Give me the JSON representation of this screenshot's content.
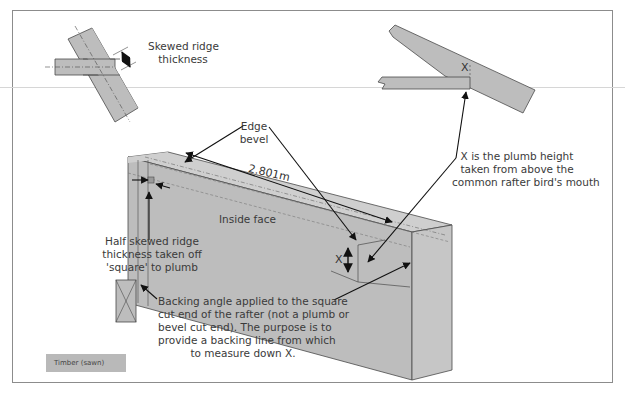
{
  "figure": {
    "labels": {
      "skewed_ridge_thickness": [
        "Skewed ridge",
        "thickness"
      ],
      "edge_bevel": [
        "Edge",
        "bevel"
      ],
      "length_dimension": "2.801m",
      "inside_face": "Inside face",
      "half_skewed_ridge": [
        "Half skewed ridge",
        "thickness taken off",
        "'square' to plumb"
      ],
      "plumb_height_note": [
        "X is the plumb height",
        "taken from above the",
        "common rafter bird's mouth"
      ],
      "backing_angle_note": [
        "Backing angle applied to the square",
        "cut end of the rafter (not a plumb or",
        "bevel cut end). The purpose is to",
        "provide a backing line from which",
        "to measure down X."
      ],
      "x_marker_top": "X",
      "x_marker_rafter": "X"
    },
    "legend": {
      "items": [
        {
          "label": "Timber (sawn)",
          "swatch_color": "#b9b9b9"
        }
      ]
    },
    "colors": {
      "timber_fill": "#bdbdbd",
      "timber_top": "#cfcfcf",
      "timber_end": "#c6c6c6",
      "stroke": "#4a4a4a",
      "arrow": "#111111",
      "frame": "#8c8c8c"
    }
  }
}
